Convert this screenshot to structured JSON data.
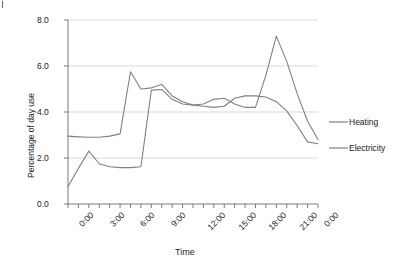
{
  "chart_data": {
    "type": "line",
    "title": "",
    "xlabel": "Time",
    "ylabel": "Percentage of day use",
    "x": [
      "0:00",
      "1:00",
      "2:00",
      "3:00",
      "4:00",
      "5:00",
      "6:00",
      "7:00",
      "8:00",
      "9:00",
      "10:00",
      "11:00",
      "12:00",
      "13:00",
      "14:00",
      "15:00",
      "16:00",
      "17:00",
      "18:00",
      "19:00",
      "20:00",
      "21:00",
      "22:00",
      "23:00",
      "0:00"
    ],
    "xtick_labels": [
      "0:00",
      "3:00",
      "6:00",
      "9:00",
      "12:00",
      "15:00",
      "18:00",
      "21:00",
      "0:00"
    ],
    "ytick_labels": [
      "0.0",
      "2.0",
      "4.0",
      "6.0",
      "8.0"
    ],
    "ylim": [
      0,
      8
    ],
    "ytick_step": 2.0,
    "xlim_hours": [
      0,
      24
    ],
    "grid": "horizontal",
    "legend_position": "right",
    "series": [
      {
        "name": "Heating",
        "color": "#808080",
        "values": [
          2.95,
          2.92,
          2.9,
          2.9,
          2.95,
          3.05,
          5.75,
          5.0,
          5.05,
          5.2,
          4.7,
          4.45,
          4.3,
          4.35,
          4.55,
          4.6,
          4.35,
          4.2,
          4.2,
          5.6,
          7.3,
          6.2,
          4.8,
          3.6,
          2.8
        ]
      },
      {
        "name": "Electricity",
        "color": "#808080",
        "values": [
          0.75,
          1.55,
          2.3,
          1.75,
          1.62,
          1.58,
          1.58,
          1.62,
          4.95,
          4.98,
          4.55,
          4.35,
          4.3,
          4.25,
          4.2,
          4.25,
          4.6,
          4.7,
          4.7,
          4.65,
          4.45,
          4.05,
          3.4,
          2.7,
          2.62
        ]
      }
    ]
  },
  "axis": {
    "y_title": "Percentage of day use",
    "x_title": "Time"
  },
  "legend": {
    "items": [
      {
        "label": "Heating"
      },
      {
        "label": "Electricity"
      }
    ]
  },
  "colors": {
    "series_line": "#808080",
    "axis": "#7a7a7a",
    "grid": "#d9d9d9",
    "text": "#1a1a1a"
  }
}
